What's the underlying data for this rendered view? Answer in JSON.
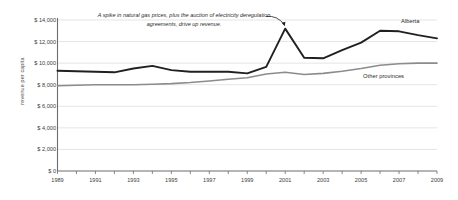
{
  "chart_data": {
    "type": "line",
    "title": "",
    "xlabel": "",
    "ylabel": "revenue per capita",
    "x": [
      1989,
      1990,
      1991,
      1992,
      1993,
      1994,
      1995,
      1996,
      1997,
      1998,
      1999,
      2000,
      2001,
      2002,
      2003,
      2004,
      2005,
      2006,
      2007,
      2008,
      2009
    ],
    "xlim": [
      1989,
      2009
    ],
    "ylim": [
      0,
      14000
    ],
    "yticks": [
      0,
      2000,
      4000,
      6000,
      8000,
      10000,
      12000,
      14000
    ],
    "ytick_labels": [
      "$ 0",
      "$ 2,000",
      "$ 4,000",
      "$ 6,000",
      "$ 8,000",
      "$ 10,000",
      "$ 12,000",
      "$ 14,000"
    ],
    "xticks": [
      1989,
      1991,
      1993,
      1995,
      1997,
      1999,
      2001,
      2003,
      2005,
      2007,
      2009
    ],
    "xtick_labels": [
      "1989",
      "1991",
      "1993",
      "1995",
      "1997",
      "1999",
      "2001",
      "2003",
      "2005",
      "2007",
      "2009"
    ],
    "grid": "horizontal",
    "legend_position": "inline-right",
    "series": [
      {
        "name": "Alberta",
        "color": "#231f20",
        "values": [
          9300,
          9250,
          9200,
          9150,
          9500,
          9750,
          9350,
          9200,
          9200,
          9200,
          9050,
          9650,
          13200,
          10500,
          10450,
          11200,
          11900,
          13000,
          12950,
          12600,
          12300
        ]
      },
      {
        "name": "Other provinces",
        "color": "#8c8c8c",
        "values": [
          7900,
          7950,
          8000,
          8000,
          8000,
          8050,
          8100,
          8200,
          8350,
          8500,
          8650,
          9000,
          9150,
          8950,
          9050,
          9250,
          9500,
          9800,
          9950,
          10000,
          10000
        ]
      }
    ],
    "annotations": [
      {
        "text": "A spike in natural gas prices, plus the auction of electricity deregulation agreements, drive up revenue.",
        "points_to_year": 2001,
        "points_to_value": 13200
      }
    ]
  },
  "series_labels": {
    "alberta": "Alberta",
    "other_provinces": "Other provinces"
  }
}
